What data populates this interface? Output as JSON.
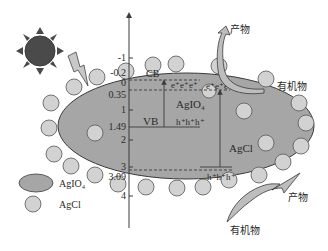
{
  "colors": {
    "ellipse_fill": "#a6a6a6",
    "particle_fill": "#d2d2d2",
    "stroke": "#3a3a3a",
    "sun_fill": "#4a4a4a",
    "arrow_fill": "#bdbdbd"
  },
  "axis": {
    "ticks": [
      {
        "label": "-1",
        "y": 58
      },
      {
        "label": "-0.2",
        "y": 73
      },
      {
        "label": "0",
        "y": 83
      },
      {
        "label": "0.35",
        "y": 90
      },
      {
        "label": "1",
        "y": 110
      },
      {
        "label": "1.49",
        "y": 127
      },
      {
        "label": "2",
        "y": 140
      },
      {
        "label": "3",
        "y": 167
      },
      {
        "label": "3.09",
        "y": 172
      },
      {
        "label": "4",
        "y": 196
      }
    ]
  },
  "bands": {
    "cb_label": "CB",
    "vb_label": "VB",
    "agio4_label": "AgIO₄",
    "agcl_label": "AgCl",
    "agio4_electrons": "e⁺e⁺e⁺",
    "agcl_electrons": "e⁺e⁺e⁺",
    "agio4_holes": "h⁺h⁺h⁺",
    "agcl_holes": "h⁺h⁺h⁺"
  },
  "annotations": {
    "product_top": "产物",
    "organic_top": "有机物",
    "product_bottom": "产物",
    "organic_bottom": "有机物"
  },
  "legend": {
    "items": [
      {
        "label": "AgIO₄",
        "shape": "ellipse"
      },
      {
        "label": "AgCl",
        "shape": "circle"
      }
    ]
  },
  "icons": {
    "sun": "sun-icon",
    "lightning": "lightning-icon"
  }
}
